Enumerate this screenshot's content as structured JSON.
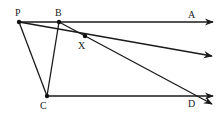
{
  "diagram": {
    "type": "geometry",
    "colors": {
      "line": "#1a1a1a",
      "point": "#111111",
      "label": "#222222",
      "background": "#ffffff"
    },
    "points": {
      "P": {
        "label": "P",
        "x": 19,
        "y": 22
      },
      "B": {
        "label": "B",
        "x": 59,
        "y": 22
      },
      "X": {
        "label": "X",
        "x": 85,
        "y": 36
      },
      "C": {
        "label": "C",
        "x": 47,
        "y": 96
      }
    },
    "ray_labels": {
      "A": {
        "label": "A"
      },
      "D": {
        "label": "D"
      }
    },
    "segments": [
      {
        "from": "P",
        "to": "B"
      },
      {
        "from": "P",
        "to": "C"
      },
      {
        "from": "B",
        "to": "C"
      }
    ],
    "rays": [
      {
        "name": "ray-PA",
        "from": "P",
        "through": "B",
        "label": "A"
      },
      {
        "name": "ray-PX",
        "from": "P",
        "through": "X",
        "label": ""
      },
      {
        "name": "ray-BX",
        "from": "B",
        "through": "X",
        "label": ""
      },
      {
        "name": "ray-CD",
        "from": "C",
        "label": "D"
      }
    ]
  }
}
